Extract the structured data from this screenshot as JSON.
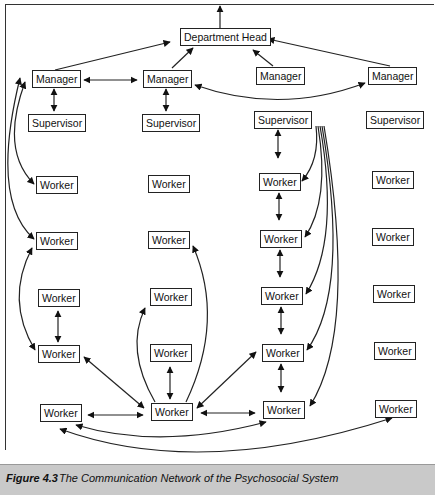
{
  "diagram": {
    "top": {
      "label": "Department Head"
    },
    "managers": [
      {
        "label": "Manager"
      },
      {
        "label": "Manager"
      },
      {
        "label": "Manager"
      },
      {
        "label": "Manager"
      }
    ],
    "supervisors": [
      {
        "label": "Supervisor"
      },
      {
        "label": "Supervisor"
      },
      {
        "label": "Supervisor"
      },
      {
        "label": "Supervisor"
      }
    ],
    "workers": [
      [
        {
          "label": "Worker"
        },
        {
          "label": "Worker"
        },
        {
          "label": "Worker"
        },
        {
          "label": "Worker"
        }
      ],
      [
        {
          "label": "Worker"
        },
        {
          "label": "Worker"
        },
        {
          "label": "Worker"
        },
        {
          "label": "Worker"
        }
      ],
      [
        {
          "label": "Worker"
        },
        {
          "label": "Worker"
        },
        {
          "label": "Worker"
        },
        {
          "label": "Worker"
        }
      ],
      [
        {
          "label": "Worker"
        },
        {
          "label": "Worker"
        },
        {
          "label": "Worker"
        },
        {
          "label": "Worker"
        }
      ],
      [
        {
          "label": "Worker"
        },
        {
          "label": "Worker"
        },
        {
          "label": "Worker"
        },
        {
          "label": "Worker"
        }
      ]
    ],
    "edges": [
      {
        "from": "Department Head",
        "to": "upward (outside)",
        "type": "one-way"
      },
      {
        "from": "Manager 1",
        "to": "Department Head",
        "type": "one-way"
      },
      {
        "from": "Manager 2",
        "to": "Department Head",
        "type": "one-way"
      },
      {
        "from": "Manager 3",
        "to": "Department Head",
        "type": "one-way"
      },
      {
        "from": "Manager 4",
        "to": "Department Head",
        "type": "one-way"
      },
      {
        "from": "Manager 1",
        "to": "Manager 2",
        "type": "two-way"
      },
      {
        "from": "Manager 2",
        "to": "Manager 4",
        "type": "two-way"
      },
      {
        "from": "Manager 1",
        "to": "Supervisor 1",
        "type": "two-way"
      },
      {
        "from": "Manager 2",
        "to": "Supervisor 2",
        "type": "two-way"
      },
      {
        "from": "Manager 1",
        "to": "Worker r1c1",
        "type": "two-way"
      },
      {
        "from": "Manager 1",
        "to": "Worker r2c1",
        "type": "two-way"
      },
      {
        "from": "Supervisor 3",
        "to": "Worker r1c3",
        "type": "two-way"
      },
      {
        "from": "Supervisor 3",
        "to": "Worker r1c3",
        "type": "one-way"
      },
      {
        "from": "Supervisor 3",
        "to": "Worker r2c3",
        "type": "one-way"
      },
      {
        "from": "Supervisor 3",
        "to": "Worker r3c3",
        "type": "one-way"
      },
      {
        "from": "Supervisor 3",
        "to": "Worker r4c3",
        "type": "one-way"
      },
      {
        "from": "Supervisor 3",
        "to": "Worker r5c3",
        "type": "one-way"
      },
      {
        "from": "Worker r1c3",
        "to": "Worker r2c3",
        "type": "two-way"
      },
      {
        "from": "Worker r2c3",
        "to": "Worker r3c3",
        "type": "two-way"
      },
      {
        "from": "Worker r3c3",
        "to": "Worker r4c3",
        "type": "two-way"
      },
      {
        "from": "Worker r4c3",
        "to": "Worker r5c3",
        "type": "two-way"
      },
      {
        "from": "Worker r3c1",
        "to": "Worker r4c1",
        "type": "two-way"
      },
      {
        "from": "Worker r2c1",
        "to": "Worker r4c1",
        "type": "two-way"
      },
      {
        "from": "Worker r4c1",
        "to": "Worker r5c2",
        "type": "two-way"
      },
      {
        "from": "Worker r5c1",
        "to": "Worker r5c2",
        "type": "two-way"
      },
      {
        "from": "Worker r4c2",
        "to": "Worker r5c2",
        "type": "two-way"
      },
      {
        "from": "Worker r5c2",
        "to": "Worker r3c2",
        "type": "one-way"
      },
      {
        "from": "Worker r5c2",
        "to": "Worker r2c2",
        "type": "one-way"
      },
      {
        "from": "Worker r5c2",
        "to": "Worker r4c3",
        "type": "two-way"
      },
      {
        "from": "Worker r5c2",
        "to": "Worker r5c3",
        "type": "two-way"
      },
      {
        "from": "Worker r5c1",
        "to": "Worker r5c3",
        "type": "two-way"
      },
      {
        "from": "Worker r5c1",
        "to": "Worker r5c4",
        "type": "two-way"
      }
    ]
  },
  "caption": {
    "number": "Figure 4.3",
    "title": "The Communication Network of the Psychosocial System"
  }
}
